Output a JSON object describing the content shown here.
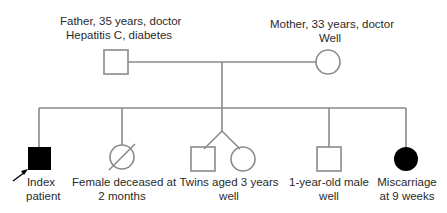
{
  "diagram": {
    "type": "pedigree",
    "parents": {
      "father": {
        "line1": "Father, 35 years, doctor",
        "line2": "Hepatitis C, diabetes",
        "sex": "male",
        "affected": false
      },
      "mother": {
        "line1": "Mother, 33 years, doctor",
        "line2": "Well",
        "sex": "female",
        "affected": false
      }
    },
    "children": [
      {
        "id": "index",
        "line1": "Index",
        "line2": "patient",
        "sex": "male",
        "affected": true,
        "proband": true
      },
      {
        "id": "female-deceased",
        "line1": "Female deceased at",
        "line2": "2 months",
        "sex": "female",
        "deceased": true
      },
      {
        "id": "twins",
        "line1": "Twins aged 3 years",
        "line2": "well",
        "twins": [
          "male",
          "female"
        ]
      },
      {
        "id": "male-1yr",
        "line1": "1-year-old male",
        "line2": "well",
        "sex": "male",
        "affected": false
      },
      {
        "id": "miscarriage",
        "line1": "Miscarriage",
        "line2": "at 9 weeks",
        "sex": "female",
        "affected": true
      }
    ],
    "colors": {
      "line": "#8a8a8a",
      "affected_fill": "#000000",
      "text": "#2a2a2a"
    }
  }
}
